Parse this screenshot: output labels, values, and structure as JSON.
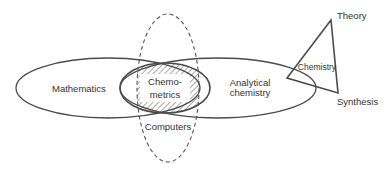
{
  "diagram": {
    "labels": {
      "mathematics": "Mathematics",
      "chemometrics_line1": "Chemo-",
      "chemometrics_line2": "metrics",
      "analytical_line1": "Analytical",
      "analytical_line2": "chemistry",
      "computers": "Computers",
      "chemistry": "Chemistry",
      "theory": "Theory",
      "synthesis": "Synthesis"
    },
    "colors": {
      "stroke": "#4a4a4a",
      "text": "#333333",
      "background": "#ffffff"
    }
  }
}
